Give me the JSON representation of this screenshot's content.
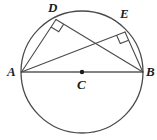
{
  "figure": {
    "kind": "geometry-diagram",
    "canvas": {
      "width": 157,
      "height": 140
    },
    "colors": {
      "background": "#ffffff",
      "stroke": "#4a4a4a",
      "chord_stroke": "#5a5a5a",
      "label": "#1b1b1b",
      "point_fill": "#1b1b1b"
    },
    "circle": {
      "name": "circle-C",
      "center": {
        "x": 82,
        "y": 72
      },
      "radius": 61,
      "stroke_width": 1.3
    },
    "points": [
      {
        "id": "A",
        "label": "A",
        "x": 21.5,
        "y": 72,
        "label_x": 7,
        "label_y": 65,
        "dot": false
      },
      {
        "id": "B",
        "label": "B",
        "x": 142.8,
        "y": 72,
        "label_x": 146,
        "label_y": 65,
        "dot": false
      },
      {
        "id": "C",
        "label": "C",
        "x": 82,
        "y": 72,
        "label_x": 77,
        "label_y": 78,
        "dot": true
      },
      {
        "id": "D",
        "label": "D",
        "x": 56,
        "y": 19.5,
        "label_x": 48,
        "label_y": 1,
        "dot": false
      },
      {
        "id": "E",
        "label": "E",
        "x": 125,
        "y": 32,
        "label_x": 120,
        "label_y": 7,
        "dot": false
      }
    ],
    "segments": [
      {
        "id": "AB",
        "name": "segment-ab-diameter",
        "from": "A",
        "to": "B",
        "width": 1.5
      },
      {
        "id": "AD",
        "name": "segment-ad",
        "from": "A",
        "to": "D",
        "width": 1.1
      },
      {
        "id": "DB",
        "name": "segment-db",
        "from": "D",
        "to": "B",
        "width": 1.1
      },
      {
        "id": "AE",
        "name": "segment-ae",
        "from": "A",
        "to": "E",
        "width": 1.1
      },
      {
        "id": "EB",
        "name": "segment-eb",
        "from": "E",
        "to": "B",
        "width": 1.1
      }
    ],
    "right_angles": [
      {
        "id": "angle-D",
        "name": "right-angle-mark-d",
        "vertex": "D",
        "ray1": "A",
        "ray2": "B",
        "size": 9
      },
      {
        "id": "angle-E",
        "name": "right-angle-mark-e",
        "vertex": "E",
        "ray1": "A",
        "ray2": "B",
        "size": 9
      }
    ],
    "center_dot": {
      "name": "center-point-c",
      "radius": 2.2
    }
  }
}
